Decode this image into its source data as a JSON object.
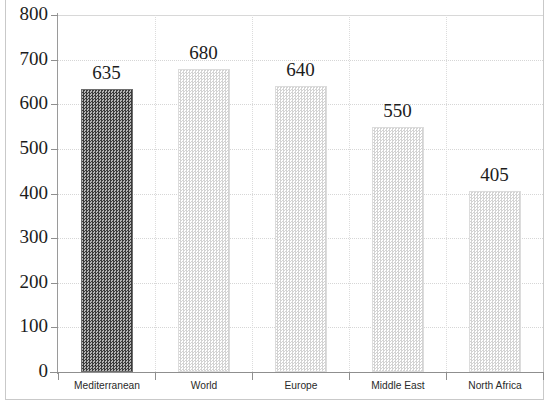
{
  "chart_data": {
    "type": "bar",
    "title": "",
    "subtitle": "",
    "xlabel": "",
    "ylabel": "",
    "categories": [
      "Mediterranean",
      "World",
      "Europe",
      "Middle East",
      "North Africa"
    ],
    "values": [
      635,
      680,
      640,
      550,
      405
    ],
    "value_labels": [
      "635",
      "680",
      "640",
      "550",
      "405"
    ],
    "series": [
      {
        "name": "",
        "values": [
          635,
          680,
          640,
          550,
          405
        ]
      }
    ],
    "ylim": [
      0,
      800
    ],
    "ytick_labels": [
      "0",
      "100",
      "200",
      "300",
      "400",
      "500",
      "600",
      "700",
      "800"
    ],
    "ytick_values": [
      0,
      100,
      200,
      300,
      400,
      500,
      600,
      700,
      800
    ],
    "grid": "horizontal-dotted-and-vertical-category-dotted",
    "legend": "none",
    "bar_styles": [
      {
        "category": "Mediterranean",
        "fill": "dark-checkerboard",
        "color": "#4a4a4a"
      },
      {
        "category": "World",
        "fill": "light-checkerboard",
        "color": "#d3d3d3"
      },
      {
        "category": "Europe",
        "fill": "light-checkerboard",
        "color": "#d3d3d3"
      },
      {
        "category": "Middle East",
        "fill": "light-checkerboard",
        "color": "#d3d3d3"
      },
      {
        "category": "North Africa",
        "fill": "light-checkerboard",
        "color": "#d3d3d3"
      }
    ],
    "axis_color": "#8f8f8f",
    "text_color": "#1c1c1c",
    "background": "#ffffff"
  }
}
